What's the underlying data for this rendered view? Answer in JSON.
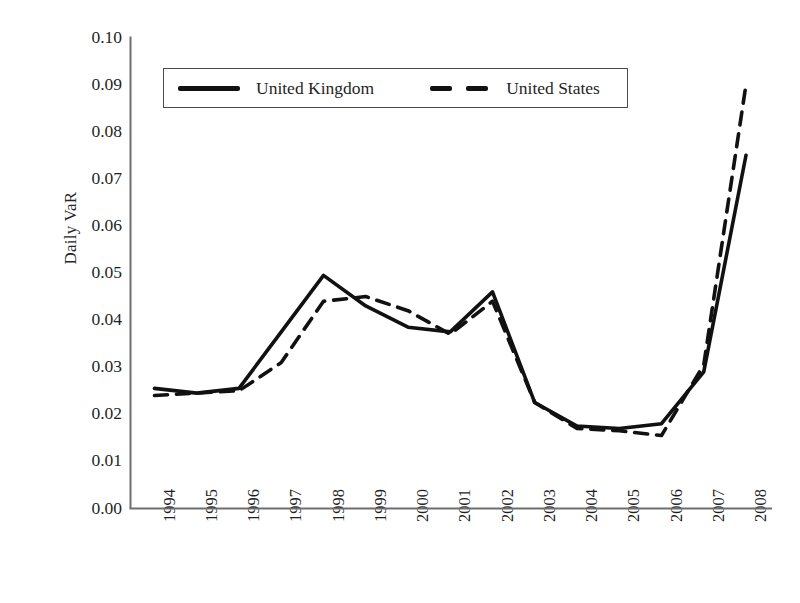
{
  "chart_data": {
    "type": "line",
    "title": "",
    "xlabel": "",
    "ylabel": "Daily VaR",
    "categories": [
      "1994",
      "1995",
      "1996",
      "1997",
      "1998",
      "1999",
      "2000",
      "2001",
      "2002",
      "2003",
      "2004",
      "2005",
      "2006",
      "2007",
      "2008"
    ],
    "x": [
      1994,
      1995,
      1996,
      1997,
      1998,
      1999,
      2000,
      2001,
      2002,
      2003,
      2004,
      2005,
      2006,
      2007,
      2008
    ],
    "ylim": [
      0.0,
      0.1
    ],
    "ytick_labels": [
      "0.10",
      "0.09",
      "0.08",
      "0.07",
      "0.06",
      "0.05",
      "0.04",
      "0.03",
      "0.02",
      "0.01",
      "0.00"
    ],
    "ytick_values": [
      0.1,
      0.09,
      0.08,
      0.07,
      0.06,
      0.05,
      0.04,
      0.03,
      0.02,
      0.01,
      0.0
    ],
    "grid": false,
    "legend_position": "top-left-inside",
    "series": [
      {
        "name": "United Kingdom",
        "style": "solid",
        "color": "#111111",
        "values": [
          0.0255,
          0.0245,
          0.0255,
          0.0375,
          0.0495,
          0.043,
          0.0385,
          0.0375,
          0.046,
          0.0225,
          0.0175,
          0.017,
          0.018,
          0.029,
          0.075
        ]
      },
      {
        "name": "United States",
        "style": "dashed",
        "color": "#111111",
        "values": [
          0.024,
          0.0245,
          0.025,
          0.031,
          0.044,
          0.045,
          0.042,
          0.037,
          0.044,
          0.0225,
          0.017,
          0.0165,
          0.0155,
          0.0305,
          0.09
        ]
      }
    ]
  },
  "legend": {
    "items": [
      {
        "label": "United Kingdom",
        "style": "solid"
      },
      {
        "label": "United States",
        "style": "dashed"
      }
    ]
  }
}
